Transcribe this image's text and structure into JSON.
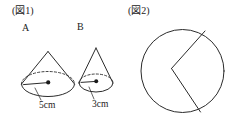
{
  "figure1": {
    "label": "(図1)",
    "solids": [
      {
        "name": "A",
        "shape": "cone",
        "dimension_label": "5cm",
        "dimension_value": 5,
        "dimension_unit": "cm",
        "dimension_meaning": "base radius"
      },
      {
        "name": "B",
        "shape": "cone",
        "dimension_label": "3cm",
        "dimension_value": 3,
        "dimension_unit": "cm",
        "dimension_meaning": "base radius"
      }
    ]
  },
  "figure2": {
    "label": "(図2)",
    "shape": "circle-with-wedge",
    "description": "circle divided by two radii meeting at an interior vertex"
  },
  "colors": {
    "ink": "#2b2b2b",
    "background": "#ffffff"
  }
}
